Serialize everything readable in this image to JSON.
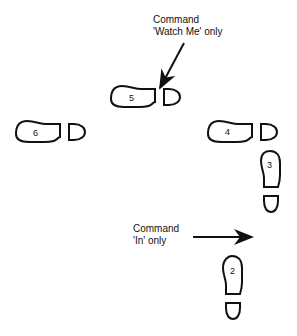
{
  "annotations": {
    "watch_me": {
      "line1": "Command",
      "line2": "'Watch Me' only"
    },
    "in": {
      "line1": "Command",
      "line2": "'In' only"
    }
  },
  "footprints": [
    {
      "id": "2",
      "label": "2",
      "orientation": "vertical"
    },
    {
      "id": "3",
      "label": "3",
      "orientation": "vertical"
    },
    {
      "id": "4",
      "label": "4",
      "orientation": "horizontal"
    },
    {
      "id": "5",
      "label": "5",
      "orientation": "horizontal"
    },
    {
      "id": "6",
      "label": "6",
      "orientation": "horizontal"
    }
  ],
  "colors": {
    "ink": "#111111",
    "background": "#ffffff"
  }
}
